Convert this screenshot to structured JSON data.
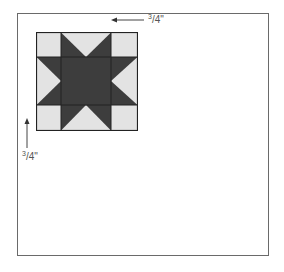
{
  "diagram": {
    "type": "quilt-block-placement",
    "block_name": "Sawtooth star block",
    "colors": {
      "light": "#e3e3e3",
      "dark": "#3d3d3d",
      "outline": "#222222",
      "frame": "#6a6a6a"
    },
    "measurements": {
      "top_offset": {
        "num": "3",
        "den": "4",
        "unit": "\""
      },
      "left_offset": {
        "num": "3",
        "den": "4",
        "unit": "\""
      }
    }
  }
}
